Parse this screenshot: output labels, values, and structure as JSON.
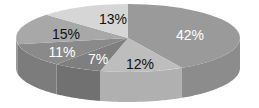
{
  "chart_data": {
    "type": "pie",
    "variant": "3d",
    "title": "",
    "start_angle_deg": 0,
    "direction": "clockwise",
    "slices": [
      {
        "label": "42%",
        "value": 42,
        "top_color": "#9a9a9a",
        "side_color": "#8c8c8c",
        "text_color": "#ffffff"
      },
      {
        "label": "12%",
        "value": 12,
        "top_color": "#bdbdbd",
        "side_color": "#b0b0b0",
        "text_color": "#111111"
      },
      {
        "label": "7%",
        "value": 7,
        "top_color": "#7f7f7f",
        "side_color": "#717171",
        "text_color": "#ffffff"
      },
      {
        "label": "11%",
        "value": 11,
        "top_color": "#8a8a8a",
        "side_color": "#7c7c7c",
        "text_color": "#ffffff"
      },
      {
        "label": "15%",
        "value": 15,
        "top_color": "#a8a8a8",
        "side_color": "#9a9a9a",
        "text_color": "#111111"
      },
      {
        "label": "13%",
        "value": 13,
        "top_color": "#d6d6d6",
        "side_color": "#c8c8c8",
        "text_color": "#111111"
      }
    ],
    "legend": null,
    "grid": false
  }
}
